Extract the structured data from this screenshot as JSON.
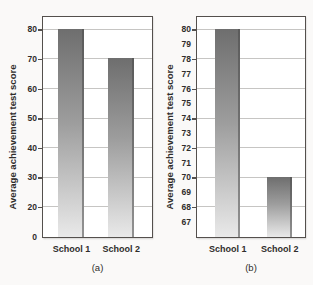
{
  "colors": {
    "background": "#faf9f8",
    "plot_background": "#ffffff",
    "box_border": "#54504d",
    "gridline": "#c6c5c3",
    "bar_top": "#6e6e6e",
    "bar_bottom": "#e9e9e9",
    "text": "#2f2d2b"
  },
  "chart_data": [
    {
      "type": "bar",
      "panel": "(a)",
      "title": "",
      "ylabel": "Average achievement test score",
      "xlabel": "",
      "categories": [
        "School 1",
        "School 2"
      ],
      "values": [
        80,
        70
      ],
      "yticks": [
        "80",
        "70",
        "60",
        "50",
        "40",
        "30",
        "20",
        "0"
      ],
      "gridlines": [
        80,
        70,
        60,
        50,
        40,
        30,
        20
      ],
      "ylim": [
        0,
        80
      ],
      "grid": "horizontal",
      "legend": "none"
    },
    {
      "type": "bar",
      "panel": "(b)",
      "title": "",
      "ylabel": "Average achievement test score",
      "xlabel": "",
      "categories": [
        "School 1",
        "School 2"
      ],
      "values": [
        80,
        70
      ],
      "yticks": [
        "80",
        "79",
        "78",
        "77",
        "76",
        "75",
        "74",
        "73",
        "72",
        "71",
        "70",
        "69",
        "68",
        "67"
      ],
      "gridlines": [
        80,
        78,
        76,
        74,
        72,
        70,
        68
      ],
      "ylim": [
        66,
        80
      ],
      "grid": "horizontal",
      "legend": "none"
    }
  ]
}
